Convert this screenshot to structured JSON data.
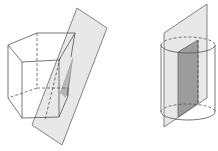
{
  "figures": [
    {
      "name": "pentagonal-prism-cut-by-plane",
      "shape": "pentagonal prism",
      "plane_fill": "#e6e6e6",
      "section_fill": "#8c8c8c"
    },
    {
      "name": "cylinder-cut-by-plane",
      "shape": "cylinder",
      "plane_fill": "#e6e6e6",
      "section_fill": "#9a9a9a"
    }
  ],
  "colors": {
    "stroke": "#555555",
    "background": "#ffffff"
  }
}
